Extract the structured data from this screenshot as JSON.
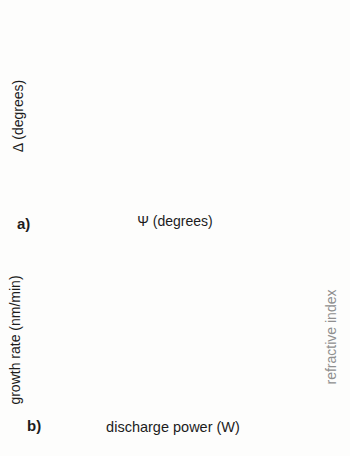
{
  "figure": {
    "background": "#fdfdfc",
    "ink_color": "#1c1c1c",
    "gray_axis_color": "#8f8f8f"
  },
  "chart_data": [
    {
      "type": "scatter",
      "tag": "a)",
      "xlabel": "Ψ (degrees)",
      "ylabel": "Δ (degrees)",
      "xlim": [
        0,
        25
      ],
      "xticks": [
        0,
        5,
        10,
        15,
        20,
        25
      ],
      "xminor": [
        2.5,
        7.5,
        12.5,
        17.5,
        22.5
      ],
      "ylim": [
        -40,
        40
      ],
      "yticks": [
        -40,
        -20,
        0,
        20,
        40
      ],
      "yminor": [
        -30,
        -10,
        10,
        30
      ],
      "grid": false,
      "description": "In-situ ellipsometry trajectories (Delta vs Psi) for discharge powers 15W-35W; loops approximated as ellipses",
      "series": [
        {
          "name": "35W",
          "marker": "circle",
          "color": "#161616",
          "msize": 2.0,
          "linewidth": 0.7,
          "loop": {
            "center": [
              10.2,
              5.5
            ],
            "rx": 6.5,
            "ry": 33.5,
            "tilt": -0.03,
            "step_deg": 8
          }
        },
        {
          "name": "30W",
          "marker": "triangle",
          "color": "#4c4c4c",
          "msize": 2.6,
          "linewidth": 0.7,
          "loop": {
            "center": [
              11.9,
              4.5
            ],
            "rx": 6.6,
            "ry": 29.6,
            "tilt": -0.02,
            "step_deg": 6.5
          }
        },
        {
          "name": "25W",
          "marker": "triangle",
          "color": "#8e8e8e",
          "msize": 1.8,
          "linewidth": 1.0,
          "loop": {
            "center": [
              11.4,
              3.5
            ],
            "rx": 4.0,
            "ry": 25.5,
            "tilt": 0.12,
            "step_deg": 3.2
          }
        },
        {
          "name": "15W-20W",
          "marker": "none",
          "color": "#c9c9c9",
          "msize": 0,
          "linewidth": 4.5,
          "arc": {
            "center": [
              14.2,
              10.0
            ],
            "rx": 7.6,
            "ry": 35.0,
            "deg_from": 198,
            "deg_to": 342
          }
        }
      ],
      "power_labels": [
        {
          "text": "15W",
          "px": [
            262,
            108
          ]
        },
        {
          "text": "20W",
          "px": [
            259,
            122
          ]
        },
        {
          "text": "25W",
          "px": [
            257,
            137
          ]
        },
        {
          "text": "30W",
          "px": [
            234,
            162
          ]
        },
        {
          "text": "35W",
          "px": [
            196,
            174
          ]
        }
      ],
      "direction_arrow": {
        "tail": [
          252,
          108
        ],
        "tip": [
          240,
          127
        ]
      },
      "trace_lines": [
        [
          [
            88,
            25
          ],
          [
            98,
            69
          ]
        ],
        [
          [
            98,
            69
          ],
          [
            137,
            84
          ],
          [
            166,
            72
          ]
        ],
        [
          [
            171,
            72
          ],
          [
            213,
            97
          ]
        ],
        [
          [
            83,
            166
          ],
          [
            124,
            147
          ],
          [
            148,
            131
          ]
        ],
        [
          [
            182,
            115
          ],
          [
            216,
            100
          ]
        ],
        [
          [
            170,
            130
          ],
          [
            207,
            118
          ]
        ],
        [
          [
            203,
            61
          ],
          [
            227,
            28
          ]
        ]
      ],
      "trace_points": [
        [
          98,
          69
        ],
        [
          137,
          84
        ],
        [
          166,
          72
        ],
        [
          171,
          72
        ]
      ]
    },
    {
      "type": "line",
      "tag": "b)",
      "xlabel": "discharge power (W)",
      "ylabel_left": "growth rate (nm/min)",
      "ylabel_right": "refractive index",
      "x": [
        15,
        20,
        25,
        30,
        35,
        40,
        45,
        50,
        55,
        60
      ],
      "xlim": [
        10,
        64
      ],
      "xticks": [
        10,
        20,
        30,
        40,
        50,
        60
      ],
      "xminor": [
        15,
        25,
        35,
        45,
        55
      ],
      "ylim_left": [
        0,
        60
      ],
      "yticks_left": [
        0,
        10,
        20,
        30,
        40,
        50,
        60
      ],
      "yminor_left": [
        5,
        15,
        25,
        35,
        45,
        55
      ],
      "ylim_right": [
        1.7,
        2.2
      ],
      "yticks_right": [
        "1.7",
        "1.8",
        "1.9",
        "2.0",
        "2.1",
        "2.2"
      ],
      "grid": false,
      "legend_position": "top-left-inside",
      "series": [
        {
          "name": "refractive index",
          "axis": "right",
          "marker": "square-open",
          "color": "#8a8a8a",
          "values": [
            1.895,
            1.895,
            1.895,
            1.895,
            1.895,
            1.905,
            2.02,
            2.12,
            2.155,
            2.155
          ]
        },
        {
          "name": "growth rate",
          "axis": "left",
          "marker": "circle-filled",
          "color": "#161616",
          "values": [
            2.5,
            3.5,
            4.5,
            6,
            9,
            15,
            31,
            38,
            43.5,
            49
          ]
        }
      ],
      "annotations": [
        {
          "text": "0,25 nm/min/W",
          "px": [
            81,
            375
          ],
          "slope_line_px": [
            [
              64,
              381
            ],
            [
              206,
              368
            ]
          ]
        },
        {
          "text": "1 nm/min/W",
          "px": [
            213,
            340
          ],
          "slope_line_px": [
            [
              194,
              339
            ],
            [
              281,
              299
            ]
          ]
        }
      ],
      "region_bar": {
        "labels": [
          "region1",
          "transition",
          "region2"
        ],
        "label_centers_px": [
          145,
          208,
          257
        ],
        "bar_px": {
          "x1": 82,
          "x2": 268,
          "y": 270,
          "h": 7
        },
        "colors": [
          "#c9c9c9",
          "#6f6f6f",
          "#3a3a3a"
        ]
      }
    }
  ]
}
